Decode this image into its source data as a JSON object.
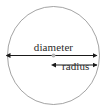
{
  "figure": {
    "background_color": "#ffffff"
  },
  "circle": {
    "name": "circle-outline",
    "stroke_color": "#8c8c8c",
    "stroke_width": 0.8,
    "center_x": 53.5,
    "center_y": 55.5,
    "radius_x": 46,
    "radius_y": 49
  },
  "center_point": {
    "name": "center-dot",
    "color": "#b0b0b0",
    "x": 53.5,
    "y": 55.5,
    "size": 2.2
  },
  "diameter": {
    "label": "diameter",
    "color": "#1a1a1a",
    "line_y": 55.5,
    "x_start": 8,
    "x_end": 99,
    "arrow_left": true,
    "arrow_right": true
  },
  "radius": {
    "label": "radius",
    "color": "#1a1a1a",
    "line_y": 65,
    "x_start": 53.5,
    "x_end": 99,
    "arrow_left": true,
    "arrow_right": true
  }
}
